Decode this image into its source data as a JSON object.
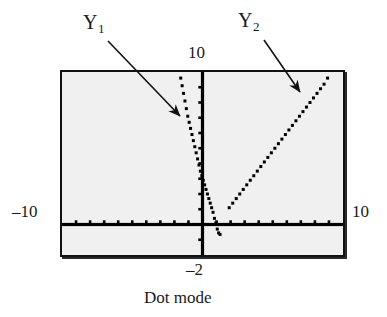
{
  "caption": "Dot mode",
  "axis_labels": {
    "y_max": "10",
    "y_min": "–2",
    "x_min": "–10",
    "x_max": "10"
  },
  "series_labels": {
    "y1_name": "Y",
    "y1_sub": "1",
    "y2_name": "Y",
    "y2_sub": "2"
  },
  "colors": {
    "screen_bg": "#f0f0f0",
    "frame": "#111111",
    "axis": "#000000",
    "plot_dots": "#000000",
    "page_bg": "#ffffff"
  },
  "chart_data": {
    "type": "scatter",
    "title": "Dot mode",
    "xlabel": "",
    "ylabel": "",
    "xlim": [
      -10,
      10
    ],
    "ylim": [
      -2,
      10
    ],
    "grid": false,
    "legend": "annotations",
    "x_ticks": [
      -9,
      -8,
      -7,
      -6,
      -5,
      -4,
      -3,
      -2,
      -1,
      1,
      2,
      3,
      4,
      5,
      6,
      7,
      8,
      9
    ],
    "y_ticks": [
      -1,
      1,
      2,
      3,
      4,
      5,
      6,
      7,
      8,
      9
    ],
    "tick_spacing": 1,
    "annotations": [
      {
        "text": "Y1",
        "points_to": "Y1 branch, left of y-axis"
      },
      {
        "text": "Y2",
        "points_to": "Y2 line, upper right"
      }
    ],
    "series": [
      {
        "name": "Y1",
        "style": "dots",
        "description": "V-shaped absolute-value curve with vertex near x = 1.3, y = -0.6; steep left branch crossing the y-axis",
        "x": [
          -1.55,
          -1.45,
          -1.35,
          -1.25,
          -1.15,
          -1.05,
          -0.95,
          -0.85,
          -0.75,
          -0.65,
          -0.55,
          -0.45,
          -0.35,
          -0.25,
          -0.15,
          -0.05,
          0.05,
          0.15,
          0.25,
          0.35,
          0.45,
          0.55,
          0.65,
          0.75,
          0.85,
          0.95,
          1.05,
          1.15,
          1.25
        ],
        "y": [
          9.6,
          9.1,
          8.6,
          8.1,
          7.6,
          7.1,
          6.7,
          6.3,
          5.9,
          5.5,
          5.1,
          4.7,
          4.3,
          3.9,
          3.5,
          3.2,
          2.9,
          2.6,
          2.3,
          2.0,
          1.7,
          1.4,
          1.1,
          0.8,
          0.4,
          0.1,
          -0.3,
          -0.55,
          -0.65
        ]
      },
      {
        "name": "Y2",
        "style": "dots",
        "description": "Straight line of positive slope, from about (1.9, 1.1) up to (8.9, 9.6)",
        "x": [
          1.9,
          2.15,
          2.4,
          2.65,
          2.9,
          3.15,
          3.4,
          3.65,
          3.9,
          4.15,
          4.4,
          4.65,
          4.9,
          5.15,
          5.4,
          5.65,
          5.9,
          6.15,
          6.4,
          6.65,
          6.9,
          7.15,
          7.4,
          7.65,
          7.9,
          8.15,
          8.4,
          8.65,
          8.9
        ],
        "y": [
          1.1,
          1.4,
          1.7,
          2.0,
          2.3,
          2.6,
          2.9,
          3.2,
          3.5,
          3.8,
          4.1,
          4.4,
          4.7,
          5.0,
          5.3,
          5.6,
          5.9,
          6.2,
          6.5,
          6.8,
          7.1,
          7.4,
          7.7,
          8.0,
          8.3,
          8.6,
          8.9,
          9.2,
          9.6
        ]
      }
    ]
  }
}
